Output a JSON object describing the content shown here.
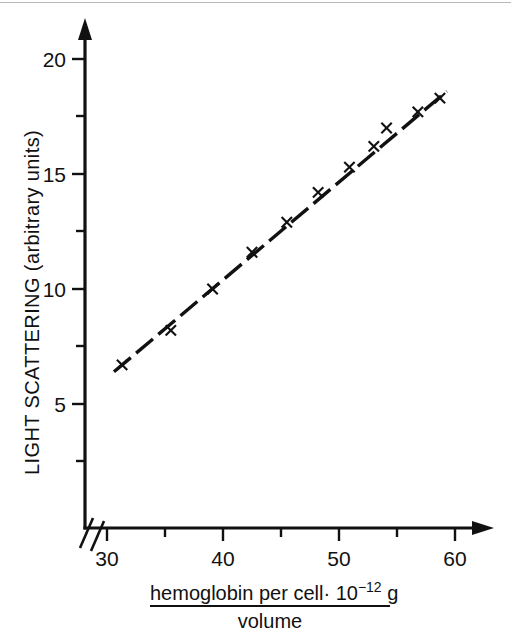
{
  "figure": {
    "caption_present": false,
    "background_color": "#ffffff",
    "ink_color": "#111111"
  },
  "axes": {
    "y": {
      "title_line1": "LIGHT SCATTERING (arbitrary units)",
      "tick_labels": [
        "5",
        "10",
        "15",
        "20"
      ],
      "tick_values": [
        5,
        10,
        15,
        20
      ],
      "minor_tick_values": [
        2.5,
        7.5,
        12.5,
        17.5
      ],
      "has_arrow": true
    },
    "x": {
      "title_numerator_a": "hemoglobin per cell",
      "title_numerator_b": "· 10",
      "title_exponent": "−12",
      "title_numerator_c": " g",
      "title_denominator": "volume",
      "tick_labels": [
        "30",
        "40",
        "50",
        "60"
      ],
      "tick_values": [
        30,
        40,
        50,
        60
      ],
      "minor_tick_values": [
        35,
        45,
        55
      ],
      "has_arrow": true,
      "has_axis_break": true,
      "axis_break_symbol": "//"
    }
  },
  "chart_data": {
    "type": "scatter",
    "title": "",
    "xlabel": "hemoglobin per cell·10⁻¹² g / volume",
    "ylabel": "LIGHT SCATTERING (arbitrary units)",
    "xlim": [
      29.0,
      61.5
    ],
    "ylim": [
      0,
      21.5
    ],
    "grid": false,
    "legend": null,
    "marker_style": "x",
    "line_style": "dashed",
    "series": [
      {
        "name": "light scattering vs hemoglobin concentration",
        "x": [
          31.3,
          35.5,
          39.1,
          42.5,
          45.5,
          48.2,
          50.9,
          53.0,
          54.1,
          56.8,
          58.7
        ],
        "y": [
          6.7,
          8.2,
          10.0,
          11.6,
          12.9,
          14.2,
          15.3,
          16.2,
          17.0,
          17.7,
          18.3
        ]
      }
    ],
    "fit_line": {
      "x_start": 30.6,
      "y_start": 6.4,
      "x_end": 59.3,
      "y_end": 18.6
    }
  }
}
